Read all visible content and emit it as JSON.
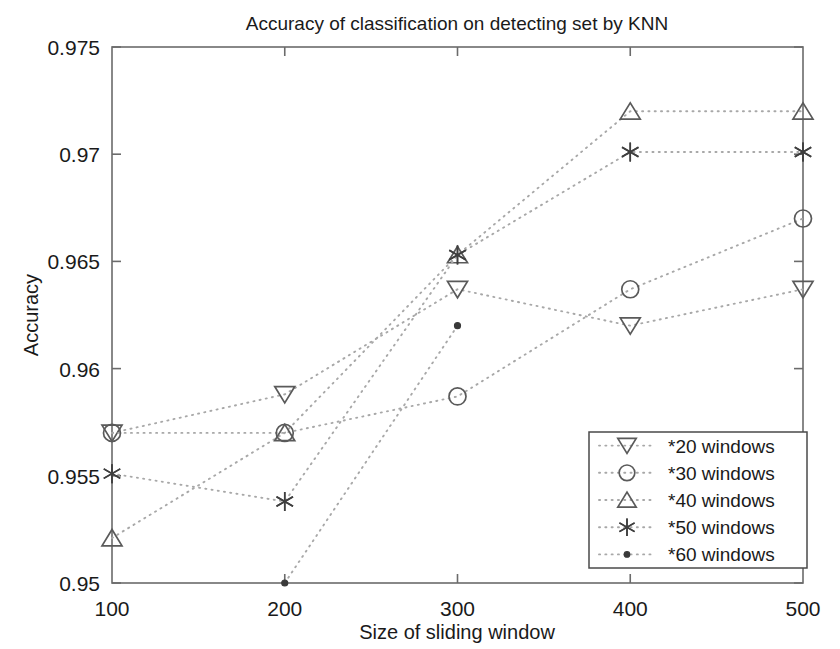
{
  "chart_data": {
    "type": "line",
    "title": "Accuracy of classification on detecting set by KNN",
    "xlabel": "Size of sliding window",
    "ylabel": "Accuracy",
    "x": [
      100,
      200,
      300,
      400,
      500
    ],
    "xticklabels": [
      "100",
      "200",
      "300",
      "400",
      "500"
    ],
    "yticks": [
      0.95,
      0.955,
      0.96,
      0.965,
      0.97,
      0.975
    ],
    "yticklabels": [
      "0.95",
      "0.955",
      "0.96",
      "0.965",
      "0.97",
      "0.975"
    ],
    "xlim": [
      100,
      500
    ],
    "ylim": [
      0.95,
      0.975
    ],
    "grid": false,
    "legend_position": "lower right",
    "linestyle": "dotted",
    "series": [
      {
        "name": "*20 windows",
        "marker": "down-triangle",
        "values": [
          0.957,
          0.9588,
          0.9637,
          0.962,
          0.9637
        ]
      },
      {
        "name": "*30 windows",
        "marker": "circle",
        "values": [
          0.957,
          0.957,
          0.9587,
          0.9637,
          0.967
        ]
      },
      {
        "name": "*40 windows",
        "marker": "up-triangle",
        "values": [
          0.9521,
          0.957,
          0.9653,
          0.972,
          0.972
        ]
      },
      {
        "name": "*50 windows",
        "marker": "asterisk",
        "values": [
          0.9551,
          0.9538,
          0.9653,
          0.9701,
          0.9701
        ]
      },
      {
        "name": "*60 windows",
        "marker": "dot",
        "values": [
          null,
          0.95,
          0.962,
          null,
          null
        ]
      }
    ]
  },
  "colors": {
    "line": "#a8a8a8",
    "marker": "#4a4a4a",
    "axis": "#6b6b6b",
    "text": "#1a1a1a",
    "background": "#ffffff"
  }
}
